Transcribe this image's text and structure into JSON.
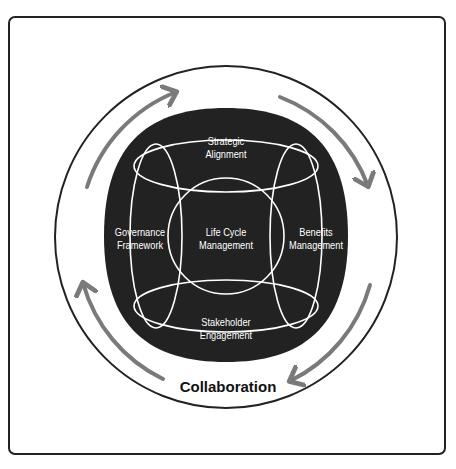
{
  "diagram": {
    "type": "framework",
    "center": {
      "label_line1": "Life Cycle",
      "label_line2": "Management"
    },
    "nodes": [
      {
        "id": "top",
        "line1": "Strategic",
        "line2": "Alignment"
      },
      {
        "id": "left",
        "line1": "Governance",
        "line2": "Framework"
      },
      {
        "id": "right",
        "line1": "Benefits",
        "line2": "Management"
      },
      {
        "id": "bottom",
        "line1": "Stakeholder",
        "line2": "Engagement"
      }
    ],
    "outer_ring_label": "Collaboration",
    "arrows": [
      "clockwise-top-left",
      "clockwise-top-right",
      "clockwise-bottom-right",
      "clockwise-bottom-left"
    ],
    "colors": {
      "blob": "#222222",
      "lines": "#ffffff",
      "arrows": "#7a7a7a",
      "ring": "#222222",
      "text_dark": "#111111"
    }
  }
}
